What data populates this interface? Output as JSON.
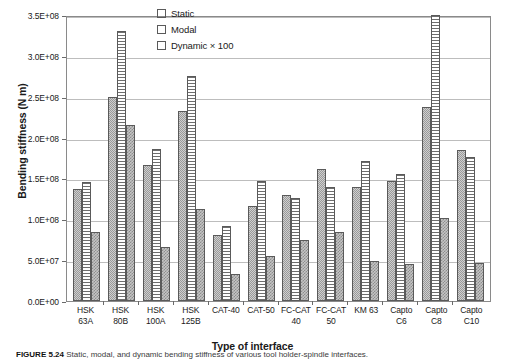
{
  "chart_data": {
    "type": "bar",
    "title": "",
    "xlabel": "Type of interface",
    "ylabel": "Bending stiffness (N m)",
    "ylim": [
      0,
      350000000
    ],
    "ytick_labels": [
      "3.5E+08",
      "3.0E+08",
      "2.5E+08",
      "2.0E+08",
      "1.5E+08",
      "1.0E+08",
      "5.0E+07",
      "0.0E+00"
    ],
    "ytick_values": [
      350000000,
      300000000,
      250000000,
      200000000,
      150000000,
      100000000,
      50000000,
      0
    ],
    "grid": true,
    "legend_position": "top-center",
    "categories": [
      "HSK\n63A",
      "HSK\n80B",
      "HSK\n100A",
      "HSK\n125B",
      "CAT-40",
      "CAT-50",
      "FC-CAT\n40",
      "FC-CAT\n50",
      "KM 63",
      "Capto\nC6",
      "Capto\nC8",
      "Capto\nC10"
    ],
    "series": [
      {
        "name": "Static",
        "pattern": "checker",
        "values": [
          137000000,
          250000000,
          167000000,
          233000000,
          81000000,
          116000000,
          130000000,
          162000000,
          140000000,
          147000000,
          238000000,
          185000000
        ]
      },
      {
        "name": "Modal",
        "pattern": "horizontal-lines",
        "values": [
          146000000,
          331000000,
          186000000,
          275000000,
          92000000,
          147000000,
          126000000,
          140000000,
          171000000,
          155000000,
          350000000,
          176000000
        ]
      },
      {
        "name": "Dynamic × 100",
        "pattern": "speckle",
        "values": [
          85000000,
          215000000,
          66000000,
          112000000,
          33000000,
          55000000,
          75000000,
          84000000,
          49000000,
          45000000,
          102000000,
          47000000
        ]
      }
    ]
  },
  "legend": {
    "items": [
      {
        "label": "Static"
      },
      {
        "label": "Modal"
      },
      {
        "label": "Dynamic × 100"
      }
    ]
  },
  "caption": {
    "label": "FIGURE 5.24",
    "text": "Static, modal, and dynamic bending stiffness of various tool holder-spindle interfaces."
  }
}
